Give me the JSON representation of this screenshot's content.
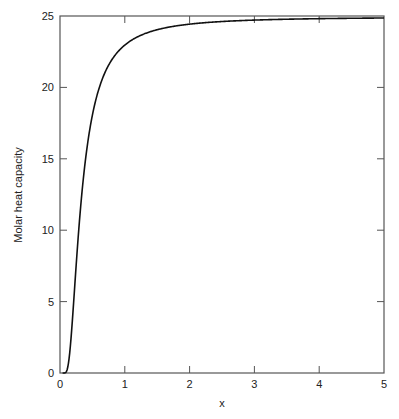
{
  "chart_data": {
    "type": "line",
    "title": "",
    "xlabel": "x",
    "ylabel": "Molar heat capacity",
    "xlim": [
      0,
      5
    ],
    "ylim": [
      0,
      25
    ],
    "xticks": [
      0,
      1,
      2,
      3,
      4,
      5
    ],
    "yticks": [
      0,
      5,
      10,
      15,
      20,
      25
    ],
    "grid": false,
    "legend": null,
    "series": [
      {
        "name": "Molar heat capacity",
        "color": "#111111",
        "x": [
          0.05,
          0.1,
          0.15,
          0.2,
          0.25,
          0.3,
          0.4,
          0.5,
          0.6,
          0.7,
          0.8,
          1.0,
          1.25,
          1.5,
          2.0,
          2.5,
          3.0,
          4.0,
          5.0
        ],
        "y": [
          0.0,
          0.11,
          1.41,
          4.26,
          7.59,
          10.64,
          15.19,
          18.06,
          19.89,
          21.09,
          21.92,
          22.96,
          23.65,
          24.03,
          24.43,
          24.61,
          24.71,
          24.81,
          24.86
        ]
      }
    ]
  }
}
